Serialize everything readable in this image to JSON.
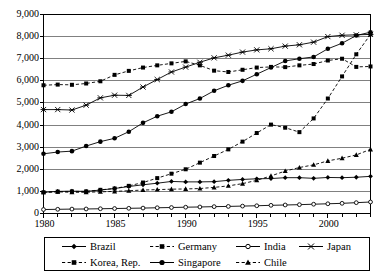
{
  "chart_data": {
    "type": "line",
    "title": "",
    "xlabel": "",
    "ylabel": "",
    "xlim": [
      1980,
      2003
    ],
    "ylim": [
      0,
      9000
    ],
    "grid": true,
    "legend_position": "bottom",
    "y_ticks": [
      "0",
      "1,000",
      "2,000",
      "3,000",
      "4,000",
      "5,000",
      "6,000",
      "7,000",
      "8,000",
      "9,000"
    ],
    "y_tick_values": [
      0,
      1000,
      2000,
      3000,
      4000,
      5000,
      6000,
      7000,
      8000,
      9000
    ],
    "x_ticks": [
      "1980",
      "1985",
      "1990",
      "1995",
      "2000"
    ],
    "x_tick_values": [
      1980,
      1985,
      1990,
      1995,
      2000
    ],
    "x": [
      1980,
      1981,
      1982,
      1983,
      1984,
      1985,
      1986,
      1987,
      1988,
      1989,
      1990,
      1991,
      1992,
      1993,
      1994,
      1995,
      1996,
      1997,
      1998,
      1999,
      2000,
      2001,
      2002,
      2003
    ],
    "series": [
      {
        "name": "Brazil",
        "marker": "diamond",
        "line": "solid",
        "values": [
          960,
          1000,
          1010,
          1000,
          1060,
          1130,
          1220,
          1300,
          1370,
          1450,
          1430,
          1430,
          1440,
          1500,
          1540,
          1570,
          1580,
          1620,
          1620,
          1590,
          1630,
          1620,
          1640,
          1680
        ]
      },
      {
        "name": "Germany",
        "marker": "square",
        "line": "dashed",
        "values": [
          5800,
          5830,
          5820,
          5880,
          5980,
          6270,
          6450,
          6600,
          6700,
          6790,
          6880,
          6700,
          6460,
          6400,
          6500,
          6600,
          6630,
          6620,
          6700,
          6760,
          6920,
          7000,
          6630,
          6650
        ]
      },
      {
        "name": "India",
        "marker": "circle-open",
        "line": "solid",
        "values": [
          180,
          190,
          200,
          205,
          215,
          225,
          235,
          245,
          260,
          270,
          285,
          295,
          310,
          320,
          335,
          350,
          370,
          385,
          400,
          420,
          440,
          460,
          490,
          520
        ]
      },
      {
        "name": "Japan",
        "marker": "star",
        "line": "solid",
        "values": [
          4700,
          4700,
          4680,
          4900,
          5230,
          5350,
          5340,
          5720,
          6060,
          6400,
          6620,
          6840,
          7040,
          7160,
          7300,
          7400,
          7450,
          7570,
          7630,
          7750,
          8000,
          8060,
          8080,
          8100
        ]
      },
      {
        "name": "Korea, Rep.",
        "marker": "square",
        "line": "dashed",
        "values": [
          960,
          990,
          1000,
          1000,
          1070,
          1130,
          1250,
          1400,
          1600,
          1800,
          2000,
          2300,
          2600,
          2900,
          3250,
          3640,
          4020,
          3880,
          3680,
          4300,
          5200,
          6200,
          7200,
          8100
        ]
      },
      {
        "name": "Singapore",
        "marker": "circle-filled",
        "line": "solid",
        "values": [
          2700,
          2780,
          2820,
          3050,
          3250,
          3400,
          3700,
          4100,
          4400,
          4600,
          4950,
          5200,
          5550,
          5800,
          6000,
          6300,
          6600,
          6900,
          7000,
          7080,
          7450,
          7700,
          8050,
          8200
        ]
      },
      {
        "name": "Chile",
        "marker": "triangle",
        "line": "dashed",
        "values": [
          960,
          980,
          960,
          960,
          980,
          1000,
          1030,
          1060,
          1080,
          1100,
          1110,
          1130,
          1180,
          1250,
          1350,
          1500,
          1700,
          1920,
          2080,
          2200,
          2380,
          2500,
          2650,
          2900
        ]
      }
    ]
  },
  "legend": {
    "items": [
      {
        "label": "Brazil",
        "marker": "diamond",
        "line": "solid"
      },
      {
        "label": "Germany",
        "marker": "square",
        "line": "dashed"
      },
      {
        "label": "India",
        "marker": "circle-open",
        "line": "solid"
      },
      {
        "label": "Japan",
        "marker": "star",
        "line": "solid"
      },
      {
        "label": "Korea, Rep.",
        "marker": "square",
        "line": "dashed"
      },
      {
        "label": "Singapore",
        "marker": "circle-filled",
        "line": "solid"
      },
      {
        "label": "Chile",
        "marker": "triangle",
        "line": "dashed"
      }
    ]
  },
  "colors": {
    "line": "#000000",
    "grid": "#808080",
    "axis": "#000000",
    "background": "#ffffff"
  }
}
